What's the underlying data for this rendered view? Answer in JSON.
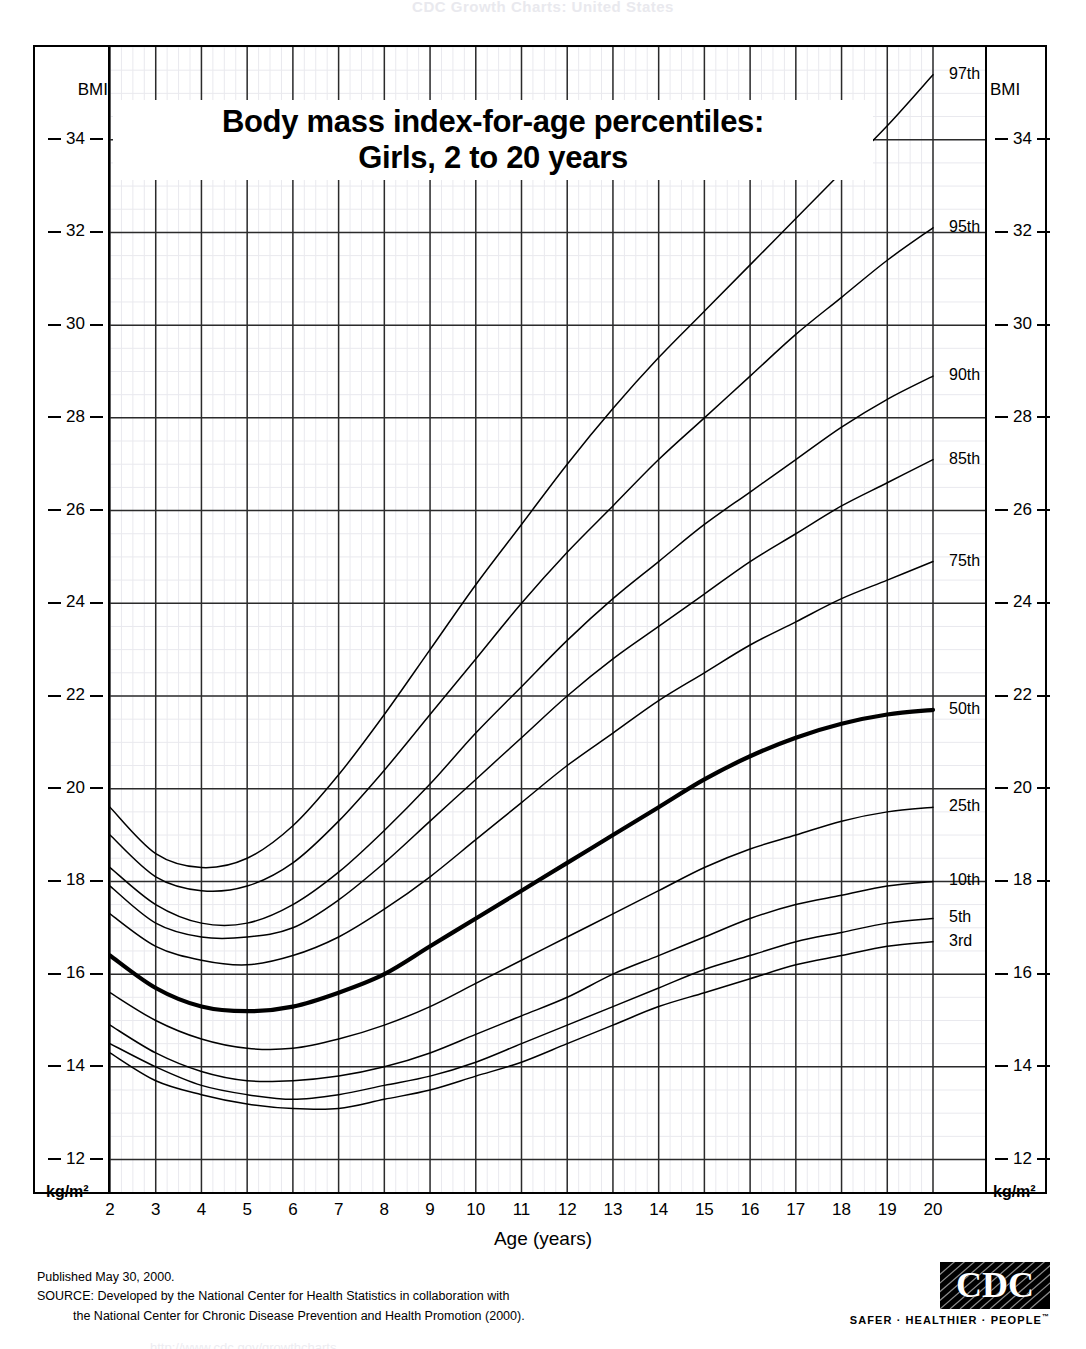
{
  "header": {
    "cut_top_text": "CDC Growth Charts: United States",
    "cut_bottom_text": "http://www.cdc.gov/growthcharts"
  },
  "title": {
    "line1": "Body mass index-for-age percentiles:",
    "line2": "Girls, 2 to 20 years"
  },
  "axes": {
    "y_cap_left": "BMI",
    "y_cap_right": "BMI",
    "y_unit_left": "kg/m²",
    "y_unit_right": "kg/m²",
    "x_title": "Age (years)",
    "y_ticks": [
      34,
      32,
      30,
      28,
      26,
      24,
      22,
      20,
      18,
      16,
      14,
      12
    ],
    "x_ticks": [
      2,
      3,
      4,
      5,
      6,
      7,
      8,
      9,
      10,
      11,
      12,
      13,
      14,
      15,
      16,
      17,
      18,
      19,
      20
    ]
  },
  "footer": {
    "published": "Published May 30, 2000.",
    "source_line1": "SOURCE: Developed by the National Center for Health Statistics in collaboration with",
    "source_line2": "the National Center for Chronic Disease Prevention and Health Promotion (2000).",
    "logo_text": "CDC",
    "logo_tagline": "SAFER · HEALTHIER · PEOPLE",
    "logo_tm": "™"
  },
  "chart_data": {
    "type": "line",
    "title": "Body mass index-for-age percentiles: Girls, 2 to 20 years",
    "xlabel": "Age (years)",
    "ylabel": "BMI",
    "yunit": "kg/m²",
    "xlim": [
      2,
      20
    ],
    "ylim": [
      11.3,
      36.0
    ],
    "grid": true,
    "grid_major_x": 1,
    "grid_major_y": 2,
    "legend": "curve-end labels on right",
    "x": [
      2,
      3,
      4,
      5,
      6,
      7,
      8,
      9,
      10,
      11,
      12,
      13,
      14,
      15,
      16,
      17,
      18,
      19,
      20
    ],
    "series": [
      {
        "name": "97th",
        "label": "97th",
        "values": [
          19.6,
          18.6,
          18.3,
          18.5,
          19.2,
          20.3,
          21.6,
          23.0,
          24.4,
          25.7,
          27.0,
          28.2,
          29.3,
          30.3,
          31.3,
          32.3,
          33.3,
          34.3,
          35.4
        ]
      },
      {
        "name": "95th",
        "label": "95th",
        "values": [
          19.0,
          18.1,
          17.8,
          17.9,
          18.4,
          19.3,
          20.4,
          21.6,
          22.8,
          24.0,
          25.1,
          26.1,
          27.1,
          28.0,
          28.9,
          29.8,
          30.6,
          31.4,
          32.1
        ]
      },
      {
        "name": "90th",
        "label": "90th",
        "values": [
          18.3,
          17.5,
          17.1,
          17.1,
          17.5,
          18.2,
          19.1,
          20.1,
          21.2,
          22.2,
          23.2,
          24.1,
          24.9,
          25.7,
          26.4,
          27.1,
          27.8,
          28.4,
          28.9
        ]
      },
      {
        "name": "85th",
        "label": "85th",
        "values": [
          17.9,
          17.1,
          16.8,
          16.8,
          17.0,
          17.6,
          18.4,
          19.3,
          20.2,
          21.1,
          22.0,
          22.8,
          23.5,
          24.2,
          24.9,
          25.5,
          26.1,
          26.6,
          27.1
        ]
      },
      {
        "name": "75th",
        "label": "75th",
        "values": [
          17.3,
          16.6,
          16.3,
          16.2,
          16.4,
          16.8,
          17.4,
          18.1,
          18.9,
          19.7,
          20.5,
          21.2,
          21.9,
          22.5,
          23.1,
          23.6,
          24.1,
          24.5,
          24.9
        ]
      },
      {
        "name": "50th",
        "label": "50th",
        "emphasis": true,
        "values": [
          16.4,
          15.7,
          15.3,
          15.2,
          15.3,
          15.6,
          16.0,
          16.6,
          17.2,
          17.8,
          18.4,
          19.0,
          19.6,
          20.2,
          20.7,
          21.1,
          21.4,
          21.6,
          21.7
        ]
      },
      {
        "name": "25th",
        "label": "25th",
        "values": [
          15.6,
          15.0,
          14.6,
          14.4,
          14.4,
          14.6,
          14.9,
          15.3,
          15.8,
          16.3,
          16.8,
          17.3,
          17.8,
          18.3,
          18.7,
          19.0,
          19.3,
          19.5,
          19.6
        ]
      },
      {
        "name": "10th",
        "label": "10th",
        "values": [
          14.9,
          14.3,
          13.9,
          13.7,
          13.7,
          13.8,
          14.0,
          14.3,
          14.7,
          15.1,
          15.5,
          16.0,
          16.4,
          16.8,
          17.2,
          17.5,
          17.7,
          17.9,
          18.0
        ]
      },
      {
        "name": "5th",
        "label": "5th",
        "values": [
          14.5,
          14.0,
          13.6,
          13.4,
          13.3,
          13.4,
          13.6,
          13.8,
          14.1,
          14.5,
          14.9,
          15.3,
          15.7,
          16.1,
          16.4,
          16.7,
          16.9,
          17.1,
          17.2
        ]
      },
      {
        "name": "3rd",
        "label": "3rd",
        "values": [
          14.3,
          13.7,
          13.4,
          13.2,
          13.1,
          13.1,
          13.3,
          13.5,
          13.8,
          14.1,
          14.5,
          14.9,
          15.3,
          15.6,
          15.9,
          16.2,
          16.4,
          16.6,
          16.7
        ]
      }
    ]
  },
  "curve_labels": [
    {
      "text": "97th",
      "y_at_20": 35.4
    },
    {
      "text": "95th",
      "y_at_20": 32.1
    },
    {
      "text": "90th",
      "y_at_20": 28.9
    },
    {
      "text": "85th",
      "y_at_20": 27.1
    },
    {
      "text": "75th",
      "y_at_20": 24.9
    },
    {
      "text": "50th",
      "y_at_20": 21.7
    },
    {
      "text": "25th",
      "y_at_20": 19.6
    },
    {
      "text": "10th",
      "y_at_20": 18.0
    },
    {
      "text": "5th",
      "y_at_20": 17.2
    },
    {
      "text": "3rd",
      "y_at_20": 16.7
    }
  ]
}
